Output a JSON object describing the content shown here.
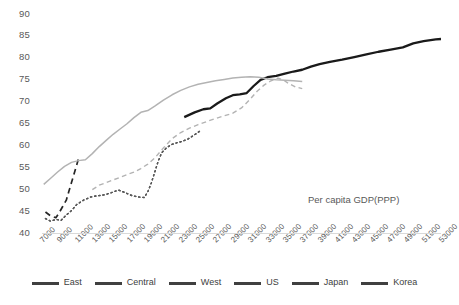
{
  "chart_data": {
    "type": "line",
    "title": "",
    "xlabel": "Per capita GDP(PPP)",
    "ylabel": "",
    "xlim": [
      7000,
      53000
    ],
    "ylim": [
      40,
      90
    ],
    "grid": false,
    "legend_position": "bottom",
    "yticks": [
      40,
      45,
      50,
      55,
      60,
      65,
      70,
      75,
      80,
      85,
      90
    ],
    "xticks": [
      7000,
      9000,
      11000,
      13000,
      15000,
      17000,
      19000,
      21000,
      23000,
      25000,
      27000,
      29000,
      31000,
      33000,
      35000,
      37000,
      39000,
      41000,
      43000,
      45000,
      47000,
      49000,
      51000,
      53000
    ],
    "series": [
      {
        "name": "East",
        "style": "dotted",
        "color": "#404040",
        "width": 1.4,
        "points": [
          [
            7400,
            43.4
          ],
          [
            8000,
            42.8
          ],
          [
            8600,
            43.2
          ],
          [
            9200,
            43.0
          ],
          [
            9800,
            44.2
          ],
          [
            10400,
            45.2
          ],
          [
            11000,
            46.6
          ],
          [
            11800,
            47.6
          ],
          [
            12600,
            48.3
          ],
          [
            13400,
            48.6
          ],
          [
            14200,
            48.8
          ],
          [
            15000,
            49.3
          ],
          [
            15800,
            49.9
          ],
          [
            16600,
            49.3
          ],
          [
            17400,
            48.6
          ],
          [
            18200,
            48.3
          ],
          [
            18800,
            48.2
          ],
          [
            19200,
            49.5
          ],
          [
            19600,
            51.5
          ],
          [
            20000,
            54.0
          ],
          [
            20400,
            56.5
          ],
          [
            20800,
            58.4
          ],
          [
            21400,
            59.6
          ],
          [
            22000,
            60.3
          ],
          [
            22600,
            60.7
          ],
          [
            23200,
            61.0
          ],
          [
            23800,
            61.5
          ],
          [
            24600,
            62.5
          ],
          [
            25400,
            63.6
          ]
        ]
      },
      {
        "name": "Central",
        "style": "dashed",
        "color": "#262626",
        "width": 1.7,
        "points": [
          [
            7400,
            44.9
          ],
          [
            8000,
            44.0
          ],
          [
            8600,
            43.6
          ],
          [
            9000,
            44.8
          ],
          [
            9400,
            46.2
          ],
          [
            9800,
            47.6
          ],
          [
            10100,
            49.6
          ],
          [
            10400,
            51.6
          ],
          [
            10700,
            53.6
          ],
          [
            11000,
            55.6
          ],
          [
            11200,
            57.0
          ]
        ]
      },
      {
        "name": "West",
        "style": "dotted",
        "color": "#595959",
        "width": 1.4,
        "points": [
          [
            7400,
            43.4
          ],
          [
            8000,
            42.8
          ],
          [
            8600,
            43.2
          ],
          [
            9200,
            43.0
          ],
          [
            9800,
            44.2
          ],
          [
            10400,
            45.2
          ],
          [
            11000,
            46.6
          ],
          [
            11800,
            47.6
          ],
          [
            12600,
            48.3
          ],
          [
            13400,
            48.6
          ],
          [
            14200,
            48.8
          ],
          [
            15000,
            49.3
          ],
          [
            15800,
            49.9
          ],
          [
            16600,
            49.3
          ],
          [
            17400,
            48.6
          ],
          [
            18200,
            48.3
          ],
          [
            18800,
            48.2
          ],
          [
            19200,
            49.5
          ],
          [
            19600,
            51.5
          ],
          [
            20000,
            54.0
          ],
          [
            20400,
            56.5
          ],
          [
            20800,
            58.4
          ],
          [
            21400,
            59.6
          ],
          [
            22000,
            60.3
          ],
          [
            22600,
            60.7
          ],
          [
            23200,
            61.0
          ],
          [
            23800,
            61.5
          ],
          [
            24600,
            62.5
          ],
          [
            25400,
            63.6
          ]
        ]
      },
      {
        "name": "US",
        "style": "solid",
        "color": "#1a1a1a",
        "width": 2.3,
        "points": [
          [
            23400,
            66.5
          ],
          [
            24600,
            67.6
          ],
          [
            25600,
            68.3
          ],
          [
            26400,
            68.5
          ],
          [
            27200,
            69.6
          ],
          [
            28200,
            70.8
          ],
          [
            29000,
            71.5
          ],
          [
            29800,
            71.7
          ],
          [
            30600,
            72.0
          ],
          [
            31400,
            73.6
          ],
          [
            32200,
            75.0
          ],
          [
            33000,
            75.6
          ],
          [
            34000,
            75.9
          ],
          [
            35000,
            76.4
          ],
          [
            36000,
            76.9
          ],
          [
            37000,
            77.3
          ],
          [
            38000,
            78.0
          ],
          [
            39000,
            78.6
          ],
          [
            40200,
            79.1
          ],
          [
            41600,
            79.6
          ],
          [
            43000,
            80.2
          ],
          [
            44400,
            80.8
          ],
          [
            45800,
            81.4
          ],
          [
            47200,
            81.9
          ],
          [
            48600,
            82.4
          ],
          [
            49800,
            83.3
          ],
          [
            51000,
            83.8
          ],
          [
            52400,
            84.2
          ],
          [
            53000,
            84.3
          ]
        ]
      },
      {
        "name": "Japan",
        "style": "dashed",
        "color": "#b3b3b3",
        "width": 1.4,
        "points": [
          [
            12800,
            50.0
          ],
          [
            13600,
            51.0
          ],
          [
            14400,
            51.6
          ],
          [
            15200,
            52.2
          ],
          [
            16000,
            52.8
          ],
          [
            16800,
            53.4
          ],
          [
            17600,
            54.0
          ],
          [
            18400,
            54.8
          ],
          [
            19200,
            55.8
          ],
          [
            20000,
            57.2
          ],
          [
            21000,
            59.5
          ],
          [
            22000,
            61.6
          ],
          [
            23000,
            63.0
          ],
          [
            24000,
            64.0
          ],
          [
            25000,
            64.8
          ],
          [
            26000,
            65.5
          ],
          [
            27000,
            66.2
          ],
          [
            28000,
            66.8
          ],
          [
            29000,
            67.4
          ],
          [
            30000,
            68.6
          ],
          [
            31000,
            70.6
          ],
          [
            31800,
            72.4
          ],
          [
            32600,
            73.8
          ],
          [
            33400,
            74.8
          ],
          [
            34200,
            75.4
          ],
          [
            34800,
            75.0
          ],
          [
            35400,
            74.2
          ],
          [
            36200,
            73.4
          ],
          [
            37000,
            73.0
          ]
        ]
      },
      {
        "name": "Korea",
        "style": "solid",
        "color": "#b3b3b3",
        "width": 1.5,
        "points": [
          [
            7200,
            51.2
          ],
          [
            8000,
            52.6
          ],
          [
            8800,
            54.0
          ],
          [
            9600,
            55.3
          ],
          [
            10400,
            56.2
          ],
          [
            11200,
            56.6
          ],
          [
            12000,
            56.8
          ],
          [
            12800,
            58.2
          ],
          [
            13600,
            59.8
          ],
          [
            14400,
            61.2
          ],
          [
            15200,
            62.6
          ],
          [
            16000,
            63.8
          ],
          [
            16800,
            65.0
          ],
          [
            17600,
            66.4
          ],
          [
            18400,
            67.6
          ],
          [
            19200,
            68.0
          ],
          [
            20000,
            69.0
          ],
          [
            21000,
            70.4
          ],
          [
            22000,
            71.6
          ],
          [
            23000,
            72.6
          ],
          [
            24000,
            73.4
          ],
          [
            25000,
            74.0
          ],
          [
            26000,
            74.4
          ],
          [
            27000,
            74.8
          ],
          [
            28000,
            75.1
          ],
          [
            29000,
            75.4
          ],
          [
            30000,
            75.6
          ],
          [
            31000,
            75.7
          ],
          [
            32000,
            75.6
          ],
          [
            33000,
            75.2
          ],
          [
            34000,
            75.0
          ],
          [
            35000,
            74.9
          ],
          [
            36000,
            74.8
          ],
          [
            37000,
            74.6
          ]
        ]
      }
    ],
    "legend": [
      {
        "label": "East",
        "style": "dotted",
        "color": "#404040"
      },
      {
        "label": "Central",
        "style": "dashed",
        "color": "#262626"
      },
      {
        "label": "West",
        "style": "dotted",
        "color": "#595959"
      },
      {
        "label": "US",
        "style": "solid",
        "color": "#1a1a1a"
      },
      {
        "label": "Japan",
        "style": "dashed",
        "color": "#b3b3b3"
      },
      {
        "label": "Korea",
        "style": "solid",
        "color": "#b3b3b3"
      }
    ]
  },
  "axis": {
    "annotation": "Per capita GDP(PPP)"
  }
}
